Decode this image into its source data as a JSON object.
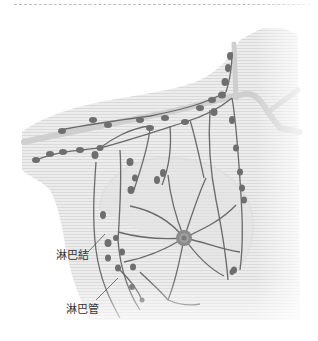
{
  "diagram": {
    "labels": {
      "lymph_node": "淋巴結",
      "lymph_vessel": "淋巴管"
    }
  },
  "colors": {
    "skin": "#e6e6e6",
    "skin_stripe": "#d6d6d6",
    "vessel": "#6a6a6a",
    "node": "#707070",
    "node_dark": "#555555",
    "vein": "#c8c8c8",
    "areola": "#8a8a8a",
    "text": "#333333",
    "rule": "#bdbdbd"
  }
}
